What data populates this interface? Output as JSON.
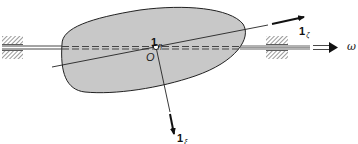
{
  "figure": {
    "colors": {
      "body_fill": "#c8c8c8",
      "stroke": "#222222",
      "background": "#ffffff"
    },
    "labels": {
      "origin": "O",
      "eta_vector": {
        "base": "1",
        "sub": "η"
      },
      "zeta_vector": {
        "base": "1",
        "sub": "ζ"
      },
      "xi_vector": {
        "base": "1",
        "sub": "ξ"
      },
      "angular_velocity": "ω"
    },
    "elements": [
      "left-bearing",
      "right-bearing",
      "shaft",
      "ellipsoid-body",
      "principal-axis-zeta",
      "principal-axis-xi",
      "origin-point",
      "angular-velocity-arrow"
    ]
  }
}
